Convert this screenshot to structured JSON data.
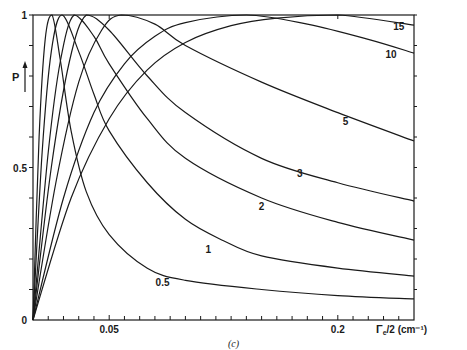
{
  "chart_data": {
    "type": "line",
    "title": "",
    "caption": "(c)",
    "xlabel": "Γe/2 (cm⁻¹)",
    "ylabel": "P",
    "xlim": [
      0,
      0.25
    ],
    "ylim": [
      0,
      1
    ],
    "x_ticks_major": [
      {
        "value": 0.05,
        "label": "0.05"
      },
      {
        "value": 0.2,
        "label": "0.2"
      }
    ],
    "x_tick_step": 0.01,
    "y_ticks_major": [
      {
        "value": 0,
        "label": "0"
      },
      {
        "value": 0.5,
        "label": "0.5"
      },
      {
        "value": 1,
        "label": "1"
      }
    ],
    "y_tick_step": 0.1,
    "grid": false,
    "legend": "inline curve labels",
    "series": [
      {
        "name": "0.5",
        "label_pos": [
          0.085,
          0.11
        ],
        "points": [
          [
            0,
            0
          ],
          [
            0.004,
            0.6
          ],
          [
            0.008,
            0.92
          ],
          [
            0.0125,
            1
          ],
          [
            0.018,
            0.85
          ],
          [
            0.025,
            0.62
          ],
          [
            0.035,
            0.42
          ],
          [
            0.05,
            0.28
          ],
          [
            0.075,
            0.17
          ],
          [
            0.1,
            0.13
          ],
          [
            0.15,
            0.1
          ],
          [
            0.2,
            0.08
          ],
          [
            0.25,
            0.069
          ]
        ]
      },
      {
        "name": "1",
        "label_pos": [
          0.115,
          0.22
        ],
        "points": [
          [
            0,
            0
          ],
          [
            0.006,
            0.55
          ],
          [
            0.012,
            0.88
          ],
          [
            0.019,
            1
          ],
          [
            0.03,
            0.88
          ],
          [
            0.04,
            0.74
          ],
          [
            0.05,
            0.62
          ],
          [
            0.075,
            0.45
          ],
          [
            0.1,
            0.33
          ],
          [
            0.125,
            0.26
          ],
          [
            0.15,
            0.21
          ],
          [
            0.2,
            0.17
          ],
          [
            0.25,
            0.144
          ]
        ]
      },
      {
        "name": "2",
        "label_pos": [
          0.15,
          0.36
        ],
        "points": [
          [
            0,
            0
          ],
          [
            0.01,
            0.55
          ],
          [
            0.018,
            0.85
          ],
          [
            0.027,
            1
          ],
          [
            0.04,
            0.93
          ],
          [
            0.05,
            0.84
          ],
          [
            0.075,
            0.66
          ],
          [
            0.1,
            0.53
          ],
          [
            0.15,
            0.4
          ],
          [
            0.2,
            0.32
          ],
          [
            0.25,
            0.262
          ]
        ]
      },
      {
        "name": "3",
        "label_pos": [
          0.175,
          0.47
        ],
        "points": [
          [
            0,
            0
          ],
          [
            0.012,
            0.5
          ],
          [
            0.024,
            0.85
          ],
          [
            0.035,
            1
          ],
          [
            0.05,
            0.95
          ],
          [
            0.075,
            0.8
          ],
          [
            0.1,
            0.68
          ],
          [
            0.15,
            0.53
          ],
          [
            0.2,
            0.45
          ],
          [
            0.25,
            0.39
          ]
        ]
      },
      {
        "name": "5",
        "label_pos": [
          0.205,
          0.64
        ],
        "points": [
          [
            0,
            0
          ],
          [
            0.015,
            0.45
          ],
          [
            0.03,
            0.78
          ],
          [
            0.045,
            0.95
          ],
          [
            0.058,
            1
          ],
          [
            0.08,
            0.97
          ],
          [
            0.1,
            0.9
          ],
          [
            0.15,
            0.78
          ],
          [
            0.2,
            0.68
          ],
          [
            0.25,
            0.587
          ]
        ]
      },
      {
        "name": "10",
        "label_pos": [
          0.235,
          0.86
        ],
        "points": [
          [
            0,
            0
          ],
          [
            0.02,
            0.4
          ],
          [
            0.04,
            0.68
          ],
          [
            0.06,
            0.84
          ],
          [
            0.08,
            0.93
          ],
          [
            0.1,
            0.975
          ],
          [
            0.14,
            1
          ],
          [
            0.18,
            0.97
          ],
          [
            0.22,
            0.92
          ],
          [
            0.25,
            0.875
          ]
        ]
      },
      {
        "name": "15",
        "label_pos": [
          0.24,
          0.95
        ],
        "points": [
          [
            0,
            0
          ],
          [
            0.025,
            0.4
          ],
          [
            0.05,
            0.66
          ],
          [
            0.075,
            0.82
          ],
          [
            0.1,
            0.91
          ],
          [
            0.13,
            0.965
          ],
          [
            0.16,
            0.99
          ],
          [
            0.2,
            1
          ],
          [
            0.25,
            0.967
          ]
        ]
      }
    ]
  },
  "labels": {
    "y_axis": "P",
    "x_axis_symbol": "Γ",
    "x_axis_sub": "e",
    "x_axis_rest": "/2 (cm⁻¹)",
    "caption": "(c)"
  }
}
